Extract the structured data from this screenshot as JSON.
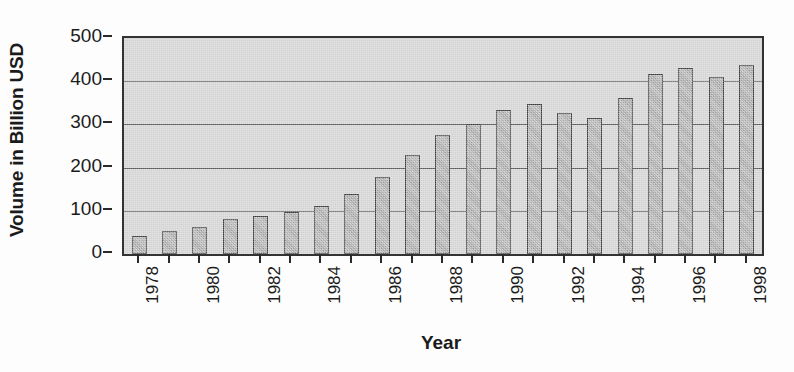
{
  "chart_data": {
    "type": "bar",
    "title": "",
    "xlabel": "Year",
    "ylabel": "Volume in Billion USD",
    "categories": [
      "1978",
      "1979",
      "1980",
      "1981",
      "1982",
      "1983",
      "1984",
      "1985",
      "1986",
      "1987",
      "1988",
      "1989",
      "1990",
      "1991",
      "1992",
      "1993",
      "1994",
      "1995",
      "1996",
      "1997",
      "1998"
    ],
    "values": [
      42,
      53,
      62,
      81,
      88,
      97,
      112,
      139,
      178,
      230,
      276,
      302,
      333,
      347,
      327,
      315,
      361,
      416,
      431,
      409,
      438
    ],
    "xtick_labels": [
      "1978",
      "1980",
      "1982",
      "1984",
      "1986",
      "1988",
      "1990",
      "1992",
      "1994",
      "1996",
      "1998"
    ],
    "ytick_labels": [
      "0",
      "100",
      "200",
      "300",
      "400",
      "500"
    ],
    "ytick_values": [
      0,
      100,
      200,
      300,
      400,
      500
    ],
    "ylim": [
      0,
      500
    ],
    "grid": "horizontal",
    "legend": "none",
    "colors": {
      "plot_background": "#d2d2d2",
      "bar_fill": "#a9a9a9",
      "bar_edge": "#3d3d3d",
      "axis": "#333333",
      "gridline": "#5a5a5a",
      "text": "#1b1b1b",
      "figure_background": "#fdfdfd"
    }
  }
}
